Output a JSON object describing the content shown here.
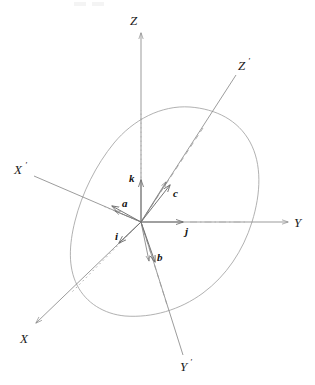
{
  "figure": {
    "background_color": "#ffffff",
    "width": 315,
    "height": 385,
    "line_color": "#8a8a8a",
    "grain_color": "#a0a0a0",
    "vector_color": "#6e6e6e",
    "text_color": "#1a1a1a"
  },
  "cartesian_axes": {
    "origin": {
      "x": 141,
      "y": 222
    },
    "labels": {
      "z": "Z",
      "y": "Y",
      "x": "X"
    }
  },
  "crystal_axes": {
    "labels": {
      "z_prime_base": "Z",
      "z_prime_mark": "′",
      "y_prime_base": "Y",
      "y_prime_mark": "′",
      "x_prime_base": "X",
      "x_prime_mark": "′"
    }
  },
  "unit_vectors": [
    {
      "label": "i",
      "name": "unit-vector-i"
    },
    {
      "label": "j",
      "name": "unit-vector-j"
    },
    {
      "label": "k",
      "name": "unit-vector-k"
    }
  ],
  "lattice_vectors": [
    {
      "label": "a",
      "name": "lattice-vector-a"
    },
    {
      "label": "b",
      "name": "lattice-vector-b"
    },
    {
      "label": "c",
      "name": "lattice-vector-c"
    }
  ],
  "grain": {
    "name": "crystal-grain-outline"
  }
}
